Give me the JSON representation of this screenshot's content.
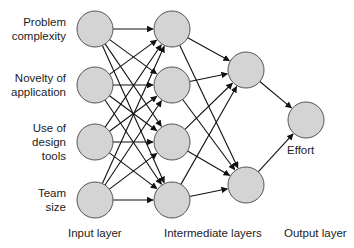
{
  "inputs": [
    {
      "line1": "Problem",
      "line2": "complexity"
    },
    {
      "line1": "Novelty of",
      "line2": "application"
    },
    {
      "line1": "Use of",
      "line2": "design",
      "line3": "tools"
    },
    {
      "line1": "Team",
      "line2": "size"
    }
  ],
  "output_label": "Effort",
  "layer_labels": {
    "input": "Input layer",
    "intermediate": "Intermediate layers",
    "output": "Output layer"
  },
  "colors": {
    "node_fill": "#d4d4d4",
    "node_stroke": "#555555",
    "edge": "#111111"
  },
  "nodes": {
    "input": [
      [
        95,
        29
      ],
      [
        95,
        85
      ],
      [
        95,
        142
      ],
      [
        95,
        200
      ]
    ],
    "hidden1": [
      [
        172,
        29
      ],
      [
        172,
        85
      ],
      [
        172,
        142
      ],
      [
        172,
        200
      ]
    ],
    "hidden2": [
      [
        246,
        70
      ],
      [
        246,
        185
      ]
    ],
    "output": [
      [
        306,
        120
      ]
    ]
  },
  "radius": 18
}
